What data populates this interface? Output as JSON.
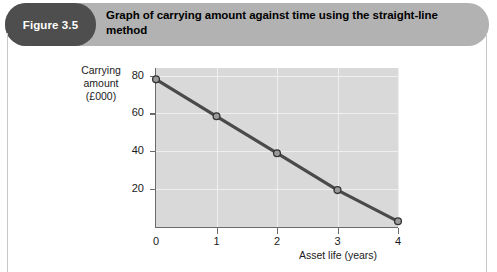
{
  "figure": {
    "badge_label": "Figure 3.5",
    "title": "Graph of carrying amount against time using the straight-line method",
    "badge_color": "#4e4e4e",
    "header_color": "#b2b2b2"
  },
  "chart_data": {
    "type": "line",
    "title": "Graph of carrying amount against time using the straight-line method",
    "xlabel": "Asset life (years)",
    "ylabel": "Carrying amount (£000)",
    "ylabel_lines": [
      "Carrying",
      "amount",
      "(£000)"
    ],
    "x": [
      0,
      1,
      2,
      3,
      4
    ],
    "values": [
      78,
      58.5,
      39,
      19.5,
      3
    ],
    "series": [
      {
        "name": "Carrying amount",
        "values": [
          78,
          58.5,
          39,
          19.5,
          3
        ],
        "line_color": "#4a4a4a",
        "marker_fill": "#9a9a9a",
        "marker_stroke": "#333333"
      }
    ],
    "xlim": [
      0,
      4
    ],
    "ylim": [
      0,
      84
    ],
    "xticks": [
      0,
      1,
      2,
      3,
      4
    ],
    "xtick_labels": [
      "0",
      "1",
      "2",
      "3",
      "4"
    ],
    "yticks": [
      20,
      40,
      60,
      80
    ],
    "ytick_labels": [
      "20",
      "40",
      "60",
      "80"
    ],
    "grid": true,
    "grid_color": "#efefef",
    "plot_bg": "#d9d9d9",
    "legend": null
  }
}
